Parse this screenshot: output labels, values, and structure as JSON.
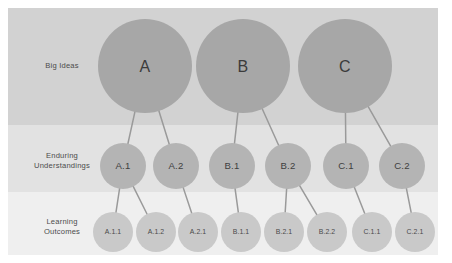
{
  "diagram": {
    "canvas": {
      "width": 452,
      "height": 263,
      "background": "#ffffff"
    },
    "frame": {
      "x": 8,
      "y": 8,
      "width": 430,
      "height": 247
    },
    "bands": [
      {
        "id": "big-ideas",
        "label": "Big Ideas",
        "label_lines": [
          "Big Ideas"
        ],
        "fill": "#d2d2d2",
        "y": 8,
        "height": 117,
        "label_x": 62,
        "label_y": 68
      },
      {
        "id": "enduring-understandings",
        "label": "Enduring Understandings",
        "label_lines": [
          "Enduring",
          "Understandings"
        ],
        "fill": "#e2e2e2",
        "y": 125,
        "height": 67,
        "label_x": 62,
        "label_y": 163
      },
      {
        "id": "learning-outcomes",
        "label": "Learning Outcomes",
        "label_lines": [
          "Learning",
          "Outcomes"
        ],
        "fill": "#efefef",
        "y": 192,
        "height": 63,
        "label_x": 62,
        "label_y": 229
      }
    ],
    "levels": [
      {
        "id": "level-1",
        "band": "big-ideas",
        "radius": 47,
        "fill": "#a7a7a7",
        "label_class": "node-label-l1"
      },
      {
        "id": "level-2",
        "band": "enduring-understandings",
        "radius": 23,
        "fill": "#b4b4b4",
        "label_class": "node-label-l2"
      },
      {
        "id": "level-3",
        "band": "learning-outcomes",
        "radius": 20,
        "fill": "#c9c9c9",
        "label_class": "node-label-l3"
      }
    ],
    "nodes": [
      {
        "id": "A",
        "label": "A",
        "level": 1,
        "cx": 145,
        "cy": 66,
        "parent": null
      },
      {
        "id": "B",
        "label": "B",
        "level": 1,
        "cx": 243,
        "cy": 66,
        "parent": null
      },
      {
        "id": "C",
        "label": "C",
        "level": 1,
        "cx": 345,
        "cy": 66,
        "parent": null
      },
      {
        "id": "A.1",
        "label": "A.1",
        "level": 2,
        "cx": 123,
        "cy": 166,
        "parent": "A"
      },
      {
        "id": "A.2",
        "label": "A.2",
        "level": 2,
        "cx": 176,
        "cy": 166,
        "parent": "A"
      },
      {
        "id": "B.1",
        "label": "B.1",
        "level": 2,
        "cx": 232,
        "cy": 166,
        "parent": "B"
      },
      {
        "id": "B.2",
        "label": "B.2",
        "level": 2,
        "cx": 288,
        "cy": 166,
        "parent": "B"
      },
      {
        "id": "C.1",
        "label": "C.1",
        "level": 2,
        "cx": 346,
        "cy": 166,
        "parent": "C"
      },
      {
        "id": "C.2",
        "label": "C.2",
        "level": 2,
        "cx": 402,
        "cy": 166,
        "parent": "C"
      },
      {
        "id": "A.1.1",
        "label": "A.1.1",
        "level": 3,
        "cx": 113,
        "cy": 232,
        "parent": "A.1"
      },
      {
        "id": "A.1.2",
        "label": "A.1.2",
        "level": 3,
        "cx": 156,
        "cy": 232,
        "parent": "A.1"
      },
      {
        "id": "A.2.1",
        "label": "A.2.1",
        "level": 3,
        "cx": 198,
        "cy": 232,
        "parent": "A.2"
      },
      {
        "id": "B.1.1",
        "label": "B.1.1",
        "level": 3,
        "cx": 241,
        "cy": 232,
        "parent": "B.1"
      },
      {
        "id": "B.2.1",
        "label": "B.2.1",
        "level": 3,
        "cx": 284,
        "cy": 232,
        "parent": "B.2"
      },
      {
        "id": "B.2.2",
        "label": "B.2.2",
        "level": 3,
        "cx": 327,
        "cy": 232,
        "parent": "B.2"
      },
      {
        "id": "C.1.1",
        "label": "C.1.1",
        "level": 3,
        "cx": 372,
        "cy": 232,
        "parent": "C.1"
      },
      {
        "id": "C.2.1",
        "label": "C.2.1",
        "level": 3,
        "cx": 415,
        "cy": 232,
        "parent": "C.2"
      }
    ],
    "connector_color": "#9a9a9a"
  }
}
